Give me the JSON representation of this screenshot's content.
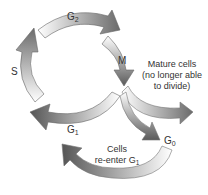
{
  "diagram": {
    "phases": {
      "g2": {
        "main": "G",
        "sub": "2"
      },
      "m": {
        "main": "M"
      },
      "s": {
        "main": "S"
      },
      "g1": {
        "main": "G",
        "sub": "1"
      },
      "g0": {
        "main": "G",
        "sub": "0"
      }
    },
    "mature": {
      "line1": "Mature cells",
      "line2": "(no longer able",
      "line3": "to divide)"
    },
    "reenter": {
      "line1": "Cells",
      "line2": "re-enter G",
      "line2_sub": "1"
    }
  }
}
